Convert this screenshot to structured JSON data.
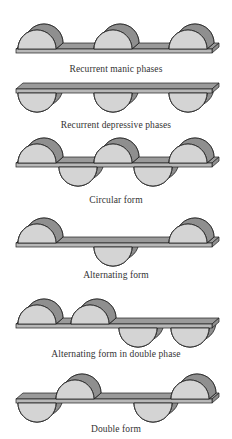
{
  "colors": {
    "face": "#d4d4d4",
    "side": "#8f8f8f",
    "bar_top": "#9a9a9a",
    "bar_front": "#b8b8b8",
    "stroke": "#1e1e1e"
  },
  "panels": [
    {
      "caption": "Recurrent manic phases",
      "bar_y": 49,
      "humps": [
        {
          "cx": 37,
          "dir": "up"
        },
        {
          "cx": 113,
          "dir": "up"
        },
        {
          "cx": 188,
          "dir": "up"
        }
      ]
    },
    {
      "caption": "Recurrent depressive phases",
      "bar_y": 89,
      "humps": [
        {
          "cx": 37,
          "dir": "down"
        },
        {
          "cx": 113,
          "dir": "down"
        },
        {
          "cx": 188,
          "dir": "down"
        }
      ]
    },
    {
      "caption": "Circular form",
      "bar_y": 163,
      "humps": [
        {
          "cx": 37,
          "dir": "up"
        },
        {
          "cx": 78,
          "dir": "down"
        },
        {
          "cx": 113,
          "dir": "up"
        },
        {
          "cx": 153,
          "dir": "down"
        },
        {
          "cx": 188,
          "dir": "up"
        }
      ]
    },
    {
      "caption": "Alternating form",
      "bar_y": 243,
      "humps": [
        {
          "cx": 37,
          "dir": "up"
        },
        {
          "cx": 113,
          "dir": "down"
        },
        {
          "cx": 188,
          "dir": "up"
        }
      ]
    },
    {
      "caption": "Alternating form in double phase",
      "bar_y": 324,
      "humps": [
        {
          "cx": 37,
          "dir": "up"
        },
        {
          "cx": 90,
          "dir": "up"
        },
        {
          "cx": 138,
          "dir": "down"
        },
        {
          "cx": 190,
          "dir": "down"
        }
      ]
    },
    {
      "caption": "Double form",
      "bar_y": 399,
      "humps": [
        {
          "cx": 37,
          "dir": "down"
        },
        {
          "cx": 75,
          "dir": "up"
        },
        {
          "cx": 153,
          "dir": "down"
        },
        {
          "cx": 190,
          "dir": "up"
        }
      ]
    }
  ],
  "caption_y": [
    70,
    126,
    201,
    276,
    355,
    430
  ]
}
